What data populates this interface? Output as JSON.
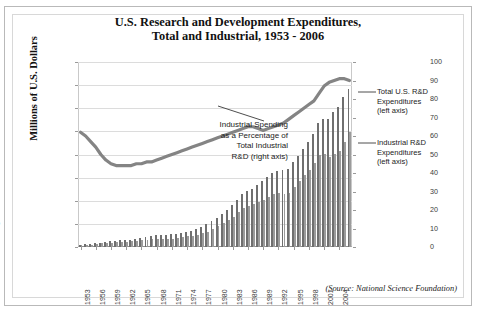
{
  "title_line1": "U.S. Research and Development Expenditures,",
  "title_line2": "Total and Industrial, 1953 - 2006",
  "ylabel_left": "Millions of U.S. Dollars",
  "annotation": "Industrial Spending as a Percentage of Total Industrial R&D (right axis)",
  "callout_total": "Total U.S. R&D Expenditures (left axis)",
  "callout_total_l1": "Total U.S. R&D",
  "callout_total_l2": "Expenditures",
  "callout_total_l3": "(left axis)",
  "callout_ind_l1": "Industrial R&D",
  "callout_ind_l2": "Expenditures",
  "callout_ind_l3": "(left axis)",
  "source": "(Source: National Science Foundation)",
  "annot_l1": "Industrial Spending",
  "annot_l2": "as a Percentage of",
  "annot_l3": "Total Industrial",
  "annot_l4": "R&D (right axis)",
  "colors": {
    "bar_total": "#6f6f6f",
    "bar_industrial": "#9b9b9b",
    "line": "#848484",
    "grid": "#dcdcdc",
    "text": "#222222"
  },
  "chart_data": {
    "type": "bar",
    "title": "U.S. Research and Development Expenditures, Total and Industrial, 1953 - 2006",
    "xlabel": "",
    "ylabel": "Millions of U.S. Dollars",
    "ylabel_right": "Percent",
    "ylim": [
      0,
      400000
    ],
    "ylim_right": [
      0,
      100
    ],
    "yticks": [
      0,
      50000,
      100000,
      150000,
      200000,
      250000,
      300000,
      350000,
      400000
    ],
    "ytick_labels": [
      "0",
      "50,000",
      "100,000",
      "150,000",
      "200,000",
      "250,000",
      "300,000",
      "350,000",
      "400,000"
    ],
    "yticks_right": [
      0,
      10,
      20,
      30,
      40,
      50,
      60,
      70,
      80,
      90,
      100
    ],
    "ytick_labels_right": [
      "0",
      "10",
      "20",
      "30",
      "40",
      "50",
      "60",
      "70",
      "80",
      "90",
      "100"
    ],
    "grid": true,
    "legend_position": "callout-right",
    "x": [
      1953,
      1954,
      1955,
      1956,
      1957,
      1958,
      1959,
      1960,
      1961,
      1962,
      1963,
      1964,
      1965,
      1966,
      1967,
      1968,
      1969,
      1970,
      1971,
      1972,
      1973,
      1974,
      1975,
      1976,
      1977,
      1978,
      1979,
      1980,
      1981,
      1982,
      1983,
      1984,
      1985,
      1986,
      1987,
      1988,
      1989,
      1990,
      1991,
      1992,
      1993,
      1994,
      1995,
      1996,
      1997,
      1998,
      1999,
      2000,
      2001,
      2002,
      2003,
      2004,
      2005,
      2006
    ],
    "xtick_labels": [
      "1953",
      "1956",
      "1959",
      "1962",
      "1965",
      "1968",
      "1971",
      "1974",
      "1977",
      "1980",
      "1983",
      "1986",
      "1989",
      "1992",
      "1995",
      "1998",
      "2001",
      "2004"
    ],
    "xtick_step": 3,
    "series": [
      {
        "name": "Total U.S. R&D Expenditures (left axis)",
        "axis": "left",
        "type": "bar",
        "color": "#6f6f6f",
        "values": [
          5124,
          5594,
          6152,
          8388,
          9738,
          10664,
          12277,
          13523,
          14138,
          15051,
          16000,
          18296,
          19601,
          21810,
          23716,
          25285,
          26326,
          26545,
          27336,
          28740,
          30952,
          33359,
          35671,
          39435,
          43978,
          49078,
          56007,
          63224,
          72292,
          80748,
          89950,
          102244,
          114671,
          120249,
          126360,
          133881,
          141891,
          152039,
          160876,
          165350,
          165730,
          169207,
          183625,
          197346,
          212675,
          226810,
          244143,
          267982,
          277852,
          277106,
          291148,
          302676,
          324509,
          341660
        ]
      },
      {
        "name": "Industrial R&D Expenditures (left axis)",
        "axis": "left",
        "type": "bar",
        "color": "#9b9b9b",
        "values": [
          3630,
          4070,
          4640,
          6605,
          7731,
          8389,
          9618,
          10509,
          10908,
          11464,
          12630,
          13512,
          14185,
          15548,
          16385,
          17429,
          18308,
          18067,
          18320,
          19552,
          21249,
          22887,
          24187,
          26997,
          29825,
          33304,
          38226,
          44505,
          51810,
          58650,
          65268,
          75012,
          84239,
          87823,
          92155,
          97015,
          102055,
          107404,
          114675,
          116952,
          115435,
          117392,
          129830,
          142371,
          155409,
          167351,
          182310,
          199539,
          202017,
          193868,
          200724,
          208303,
          226159,
          247669
        ]
      },
      {
        "name": "Industrial Spending as a Percentage of Total Industrial R&D (right axis)",
        "axis": "right",
        "type": "line",
        "color": "#848484",
        "unit": "%",
        "values": [
          62,
          60,
          57,
          54,
          50,
          47,
          45,
          44,
          44,
          44,
          44,
          45,
          45,
          46,
          46,
          47,
          48,
          49,
          50,
          51,
          52,
          53,
          54,
          55,
          56,
          57,
          58,
          59,
          60,
          61,
          62,
          63,
          64,
          65,
          65,
          64,
          63,
          64,
          65,
          66,
          67,
          69,
          71,
          73,
          75,
          77,
          79,
          83,
          87,
          89,
          90,
          91,
          91,
          90
        ]
      }
    ]
  }
}
